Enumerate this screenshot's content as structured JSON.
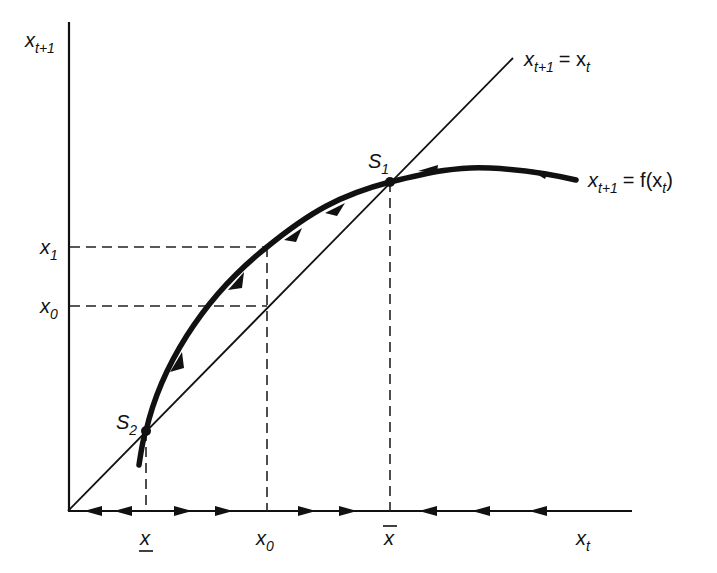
{
  "diagram": {
    "type": "phase-diagram",
    "axes": {
      "y_label": {
        "base": "x",
        "sub": "t+1"
      },
      "x_label": {
        "base": "x",
        "sub": "t"
      }
    },
    "lines": {
      "identity": {
        "label_base": "x",
        "label_sub": "t+1",
        "label_eq": "= x",
        "label_sub2": "t"
      },
      "curve": {
        "label_base": "x",
        "label_sub": "t+1",
        "label_eq": "= f(x",
        "label_sub2": "t",
        "label_close": ")"
      }
    },
    "points": {
      "s1": {
        "base": "S",
        "sub": "1"
      },
      "s2": {
        "base": "S",
        "sub": "2"
      }
    },
    "y_ticks": {
      "x1": {
        "base": "x",
        "sub": "1"
      },
      "x0": {
        "base": "x",
        "sub": "0"
      }
    },
    "x_ticks": {
      "x_low": {
        "text": "x",
        "decoration": "underline"
      },
      "x0": {
        "base": "x",
        "sub": "0"
      },
      "x_high": {
        "text": "x",
        "decoration": "overline"
      }
    },
    "colors": {
      "ink": "#111111",
      "background": "#ffffff"
    }
  }
}
